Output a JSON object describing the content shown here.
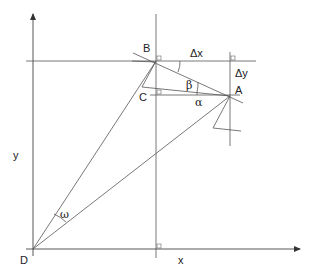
{
  "diagram": {
    "type": "geometry-coordinate-diagram",
    "axes": {
      "x_label": "x",
      "y_label": "y",
      "origin_label": "D"
    },
    "points": [
      {
        "id": "A",
        "label": "A",
        "x": 230,
        "y": 96
      },
      {
        "id": "B",
        "label": "B",
        "x": 156,
        "y": 61
      },
      {
        "id": "C",
        "label": "C",
        "x": 156,
        "y": 95
      },
      {
        "id": "D",
        "label": "D",
        "x": 33,
        "y": 249
      }
    ],
    "deltas": {
      "dx_label": "Δx",
      "dy_label": "Δy"
    },
    "angles": {
      "alpha": "α",
      "beta": "β",
      "omega": "ω"
    },
    "colors": {
      "line": "#555555",
      "text": "#222222",
      "background": "#ffffff"
    }
  }
}
